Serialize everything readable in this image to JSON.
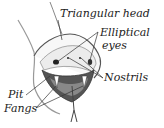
{
  "diagram": {
    "labels": {
      "triangular_head": "Triangular head",
      "elliptical": "Elliptical",
      "eyes": "eyes",
      "nostrils": "Nostrils",
      "pit": "Pit",
      "fangs": "Fangs"
    },
    "colors": {
      "ink": "#222222",
      "background": "#ffffff",
      "mouth": "#444444"
    }
  }
}
